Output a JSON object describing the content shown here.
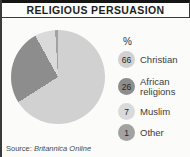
{
  "header": {
    "title": "RELIGIOUS PERSUASION"
  },
  "legend_header": "%",
  "source": {
    "prefix": "Source: ",
    "name": "Britannica Online"
  },
  "chart_data": {
    "type": "pie",
    "title": "RELIGIOUS PERSUASION",
    "unit": "%",
    "categories": [
      "Christian",
      "African religions",
      "Muslim",
      "Other"
    ],
    "values": [
      66,
      26,
      7,
      1
    ],
    "colors": [
      "#d1d1d1",
      "#8d8d8d",
      "#dadada",
      "#a2a2a2"
    ],
    "start_angle_deg": 0,
    "direction": "clockwise",
    "legend_position": "right",
    "source_note": "Source: Britannica Online"
  }
}
